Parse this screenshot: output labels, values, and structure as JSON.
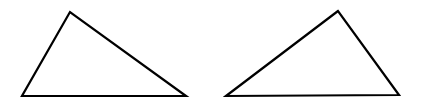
{
  "canvas": {
    "width": 421,
    "height": 107,
    "background": "#ffffff",
    "stroke_color": "#000000",
    "stroke_width": 2.2
  },
  "shapes": [
    {
      "type": "triangle",
      "label": "left-triangle",
      "points": [
        [
          70,
          12
        ],
        [
          22,
          96
        ],
        [
          186,
          96
        ]
      ]
    },
    {
      "type": "triangle",
      "label": "right-triangle",
      "points": [
        [
          338,
          11
        ],
        [
          226,
          96
        ],
        [
          399,
          95
        ]
      ]
    }
  ]
}
